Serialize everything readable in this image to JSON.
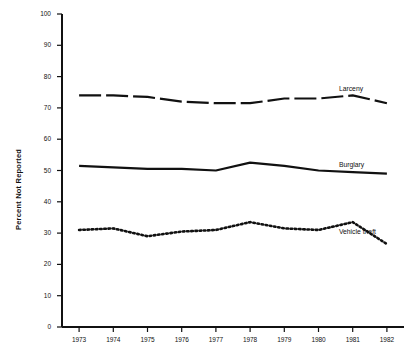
{
  "chart_data": {
    "type": "line",
    "title": "",
    "xlabel": "",
    "ylabel": "Percent Not Reported",
    "x": [
      1973,
      1974,
      1975,
      1976,
      1977,
      1978,
      1979,
      1980,
      1981,
      1982
    ],
    "categories": [
      "1973",
      "1974",
      "1975",
      "1976",
      "1977",
      "1978",
      "1979",
      "1980",
      "1981",
      "1982"
    ],
    "ylim": [
      0,
      100
    ],
    "yticks": [
      0,
      10,
      20,
      30,
      40,
      50,
      60,
      70,
      80,
      90,
      100
    ],
    "ytick_labels": [
      "0",
      "10",
      "20",
      "30",
      "40",
      "50",
      "60",
      "70",
      "80",
      "90",
      "100"
    ],
    "grid": false,
    "legend_position": "inline-right",
    "series": [
      {
        "name": "Larceny",
        "style": "dashed",
        "values": [
          74,
          74,
          73.5,
          72,
          71.5,
          71.5,
          73,
          73,
          74,
          71.5
        ]
      },
      {
        "name": "Burglary",
        "style": "solid",
        "values": [
          51.5,
          51,
          50.5,
          50.5,
          50,
          52.5,
          51.5,
          50,
          49.5,
          49
        ]
      },
      {
        "name": "Vehicle theft",
        "style": "dotted",
        "values": [
          31,
          31.5,
          29,
          30.5,
          31,
          33.5,
          31.5,
          31,
          33.5,
          26.5
        ]
      }
    ]
  },
  "axes": {
    "y_title": "Percent Not Reported"
  }
}
